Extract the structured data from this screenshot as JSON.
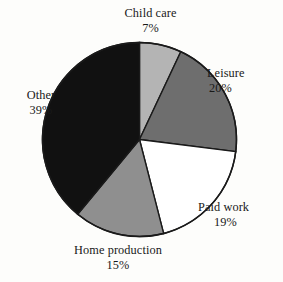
{
  "chart_data": {
    "type": "pie",
    "title": "",
    "subtitle": "",
    "xlabel": "",
    "ylabel": "",
    "legend_position": "none",
    "labels_position": "outside",
    "grid": false,
    "start_angle_deg": 0,
    "direction": "clockwise",
    "total_pct": 100,
    "categories": [
      "Child care",
      "Leisure",
      "Paid work",
      "Home production",
      "Other"
    ],
    "values": [
      7,
      20,
      19,
      15,
      39
    ],
    "value_unit": "%",
    "slices": [
      {
        "label": "Child care",
        "value": 7,
        "value_text": "7%",
        "color": "#b4b4b4",
        "start_deg": 0,
        "end_deg": 25.2
      },
      {
        "label": "Leisure",
        "value": 20,
        "value_text": "20%",
        "color": "#6e6e6e",
        "start_deg": 25.2,
        "end_deg": 97.2
      },
      {
        "label": "Paid work",
        "value": 19,
        "value_text": "19%",
        "color": "#ffffff",
        "start_deg": 97.2,
        "end_deg": 165.6
      },
      {
        "label": "Home production",
        "value": 15,
        "value_text": "15%",
        "color": "#8f8f8f",
        "start_deg": 165.6,
        "end_deg": 219.6
      },
      {
        "label": "Other",
        "value": 39,
        "value_text": "39%",
        "color": "#111111",
        "start_deg": 219.6,
        "end_deg": 360
      }
    ]
  },
  "style": {
    "background": "#fdfdfb",
    "outline_color": "#1a1a1a",
    "text_color": "#191919"
  }
}
